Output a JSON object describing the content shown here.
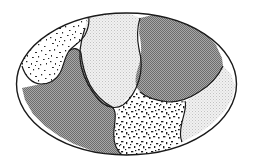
{
  "figure": {
    "title": "",
    "caption": "",
    "type": "schematic-region-map",
    "shape": "ellipse",
    "canvas": {
      "width": 254,
      "height": 166,
      "background": "#ffffff"
    },
    "outline": {
      "name": "ellipse-boundary",
      "center_x": 126.5,
      "center_y": 84,
      "radius_x": 110,
      "radius_y": 71,
      "stroke": "#1a1a1a",
      "stroke_width": 1.4,
      "fill": "#ffffff"
    },
    "regions": [
      {
        "id": "region-upper-left",
        "label": "upper-left",
        "fill_style": "fine-speckle",
        "base_color": "#ffffff",
        "fleck_color": "#2b2b2b",
        "density": "medium",
        "path": "M 22 58 L 27 44 L 36 32 L 48 23 L 62 17 L 76 14 L 88 13 L 90 22 L 86 33 L 80 41 L 72 46 L 66 54 L 64 63 L 60 72 L 53 79 L 45 83 L 36 83 L 29 78 L 23 69 Z"
      },
      {
        "id": "region-center-light",
        "label": "center",
        "fill_style": "fine-halftone",
        "base_color": "#ececec",
        "fleck_color": "#b5b5b5",
        "density": "light",
        "path": "M 90 13 L 104 12 L 118 13 L 132 15 L 140 18 L 138 30 L 139 44 L 142 58 L 141 72 L 136 86 L 128 98 L 120 106 L 110 108 L 100 103 L 92 94 L 86 83 L 82 72 L 80 61 L 82 50 L 86 36 L 90 24 Z"
      },
      {
        "id": "region-upper-right",
        "label": "upper-right",
        "fill_style": "dense-halftone",
        "base_color": "#8e8e8e",
        "fleck_color": "#5a5a5a",
        "density": "dark",
        "path": "M 140 18 L 156 15 L 172 17 L 188 22 L 202 30 L 213 40 L 220 51 L 223 62 L 219 74 L 212 84 L 202 92 L 192 98 L 182 101 L 170 101 L 158 99 L 146 96 L 138 90 L 136 80 L 140 70 L 143 58 L 141 45 L 138 32 Z"
      },
      {
        "id": "region-right-light",
        "label": "right",
        "fill_style": "fine-halftone",
        "base_color": "#ececec",
        "fleck_color": "#b5b5b5",
        "density": "light",
        "path": "M 223 62 L 230 70 L 233 82 L 231 95 L 224 108 L 214 120 L 202 130 L 190 137 L 180 140 L 180 128 L 182 116 L 186 106 L 190 99 L 201 93 L 211 85 L 219 75 Z"
      },
      {
        "id": "region-bottom-center",
        "label": "bottom-center",
        "fill_style": "coarse-speckle",
        "base_color": "#ffffff",
        "fleck_color": "#1f1f1f",
        "density": "high",
        "path": "M 138 90 L 146 96 L 158 99 L 170 101 L 182 101 L 186 107 L 182 118 L 180 130 L 180 141 L 168 147 L 154 152 L 140 154 L 126 154 L 118 150 L 115 140 L 114 128 L 116 116 L 120 106 L 128 98 Z"
      },
      {
        "id": "region-lower-left",
        "label": "lower-left",
        "fill_style": "dense-halftone",
        "base_color": "#8e8e8e",
        "fleck_color": "#5a5a5a",
        "density": "dark",
        "path": "M 36 83 L 45 83 L 53 79 L 60 72 L 64 63 L 72 58 L 80 61 L 82 72 L 86 83 L 92 94 L 100 103 L 110 108 L 116 116 L 114 128 L 115 140 L 118 150 L 108 152 L 94 152 L 80 148 L 66 142 L 53 134 L 41 124 L 31 112 L 25 99 L 23 87 Z"
      }
    ],
    "legend": {
      "visible": false,
      "items": []
    },
    "annotations": []
  }
}
